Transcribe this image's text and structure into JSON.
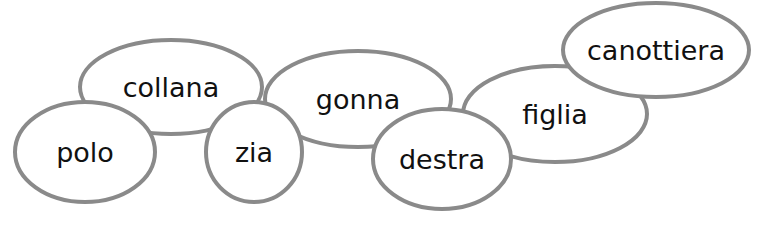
{
  "diagram": {
    "type": "word-bubbles",
    "stroke_color": "#8a8a8a",
    "text_color": "#111111",
    "bubbles": [
      {
        "label": "collana",
        "cx": 171,
        "cy": 87,
        "rx": 91,
        "ry": 47
      },
      {
        "label": "polo",
        "cx": 85,
        "cy": 152,
        "rx": 70,
        "ry": 50
      },
      {
        "label": "gonna",
        "cx": 358,
        "cy": 99,
        "rx": 93,
        "ry": 48
      },
      {
        "label": "zia",
        "cx": 254,
        "cy": 152,
        "rx": 48,
        "ry": 50
      },
      {
        "label": "figlia",
        "cx": 555,
        "cy": 114,
        "rx": 92,
        "ry": 48
      },
      {
        "label": "destra",
        "cx": 442,
        "cy": 159,
        "rx": 69,
        "ry": 50
      },
      {
        "label": "canottiera",
        "cx": 656,
        "cy": 50,
        "rx": 93,
        "ry": 47
      }
    ]
  }
}
